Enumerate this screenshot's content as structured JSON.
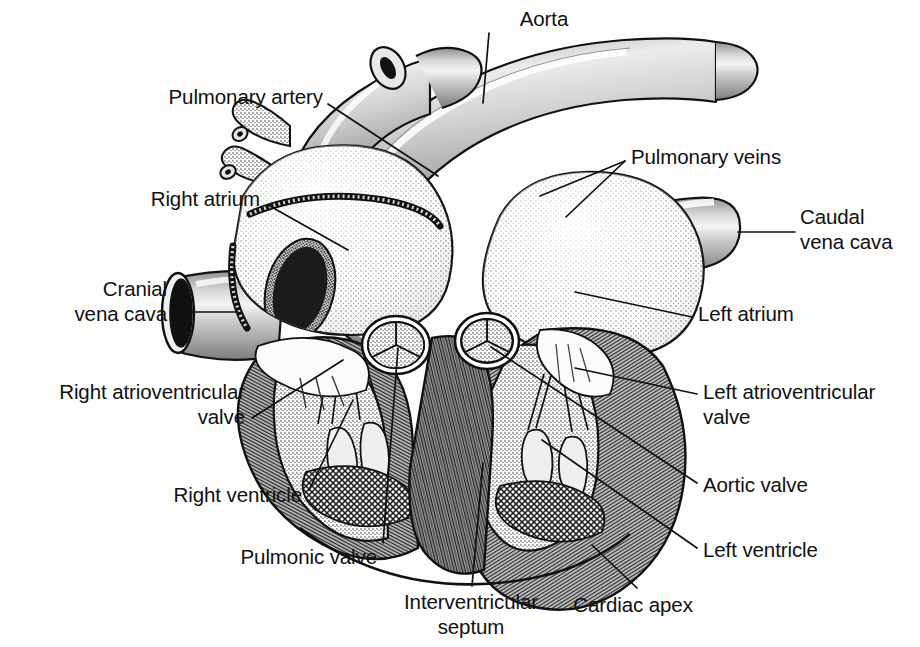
{
  "figure": {
    "style": "black-and-white stippled line drawing",
    "background_color": "#fdfdfd",
    "ink_color": "#111111",
    "width": 920,
    "height": 647
  },
  "labels": [
    {
      "id": "aorta",
      "text": "Aorta",
      "align": "center",
      "x": 489,
      "y": 6,
      "width": 110,
      "leader": [
        [
          489,
          33
        ],
        [
          483,
          103
        ]
      ]
    },
    {
      "id": "pulmonary-artery",
      "text": "Pulmonary artery",
      "align": "right",
      "x": 158,
      "y": 84,
      "width": 165,
      "leader": [
        [
          328,
          104
        ],
        [
          438,
          176
        ]
      ]
    },
    {
      "id": "pulmonary-veins",
      "text": "Pulmonary veins",
      "align": "left",
      "x": 631,
      "y": 144,
      "width": 170,
      "leader": [
        [
          625,
          161
        ],
        [
          540,
          196
        ]
      ],
      "leader2": [
        [
          625,
          161
        ],
        [
          566,
          217
        ]
      ]
    },
    {
      "id": "right-atrium",
      "text": "Right atrium",
      "align": "right",
      "x": 135,
      "y": 186,
      "width": 125,
      "leader": [
        [
          268,
          205
        ],
        [
          348,
          250
        ]
      ]
    },
    {
      "id": "caudal-vena-cava",
      "text": "Caudal\nvena cava",
      "align": "left",
      "x": 800,
      "y": 204,
      "width": 120,
      "leader": [
        [
          795,
          232
        ],
        [
          738,
          232
        ]
      ]
    },
    {
      "id": "cranial-vena-cava",
      "text": "Cranial\nvena cava",
      "align": "right",
      "x": 22,
      "y": 276,
      "width": 145,
      "leader": [
        [
          172,
          312
        ],
        [
          238,
          312
        ]
      ]
    },
    {
      "id": "left-atrium",
      "text": "Left atrium",
      "align": "left",
      "x": 698,
      "y": 301,
      "width": 115,
      "leader": [
        [
          692,
          317
        ],
        [
          575,
          292
        ]
      ]
    },
    {
      "id": "right-atrioventricular-valve",
      "text": "Right atrioventricular\nvalve",
      "align": "right",
      "x": 55,
      "y": 379,
      "width": 190,
      "leader": [
        [
          252,
          418
        ],
        [
          343,
          360
        ]
      ]
    },
    {
      "id": "left-atrioventricular-valve",
      "text": "Left atrioventricular\nvalve",
      "align": "left",
      "x": 703,
      "y": 379,
      "width": 200,
      "leader": [
        [
          697,
          394
        ],
        [
          575,
          368
        ]
      ]
    },
    {
      "id": "right-ventricle",
      "text": "Right ventricle",
      "align": "right",
      "x": 162,
      "y": 482,
      "width": 140,
      "leader": [
        [
          309,
          490
        ],
        [
          353,
          400
        ]
      ]
    },
    {
      "id": "aortic-valve",
      "text": "Aortic valve",
      "align": "left",
      "x": 703,
      "y": 472,
      "width": 125,
      "leader": [
        [
          697,
          483
        ],
        [
          491,
          347
        ]
      ]
    },
    {
      "id": "pulmonic-valve",
      "text": "Pulmonic valve",
      "align": "right",
      "x": 229,
      "y": 544,
      "width": 148,
      "leader": [
        [
          383,
          543
        ],
        [
          398,
          348
        ]
      ]
    },
    {
      "id": "left-ventricle",
      "text": "Left ventricle",
      "align": "left",
      "x": 703,
      "y": 537,
      "width": 132,
      "leader": [
        [
          697,
          548
        ],
        [
          542,
          440
        ]
      ]
    },
    {
      "id": "interventricular-septum",
      "text": "Interventricular\nseptum",
      "align": "center",
      "x": 392,
      "y": 589,
      "width": 158,
      "leader": [
        [
          472,
          586
        ],
        [
          483,
          463
        ]
      ]
    },
    {
      "id": "cardiac-apex",
      "text": "Cardiac apex",
      "align": "center",
      "x": 562,
      "y": 592,
      "width": 142,
      "leader": [
        [
          637,
          588
        ],
        [
          592,
          545
        ]
      ]
    }
  ],
  "structures": {
    "aorta": "great vessel arching to upper right",
    "pulmonary_artery": "vessel crossing in front of aorta to upper left",
    "cranial_vena_cava": "cut tube entering right atrium from the left",
    "caudal_vena_cava": "tube entering right atrium from the right",
    "pulmonary_veins": "small vessels entering left atrium",
    "right_atrium": "stippled chamber upper left",
    "left_atrium": "stippled chamber upper right",
    "right_ventricle": "sectioned chamber lower left",
    "left_ventricle": "thick-walled sectioned chamber lower right",
    "interventricular_septum": "muscular wall between ventricles",
    "pulmonic_valve": "tri-leaflet semilunar valve, left circle",
    "aortic_valve": "tri-leaflet semilunar valve, right circle",
    "cardiac_apex": "rounded bottom tip of the heart"
  }
}
